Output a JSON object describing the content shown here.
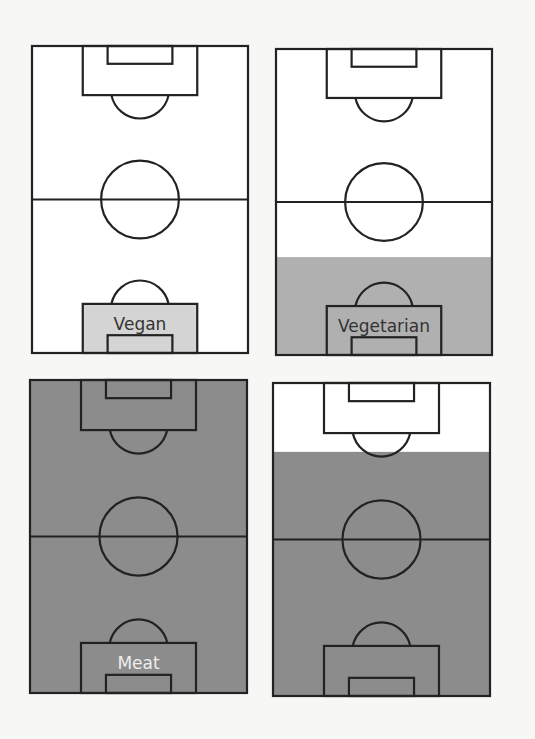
{
  "colors": {
    "background": "#f7f7f5",
    "pitch_white": "#ffffff",
    "line": "#222222",
    "vegan_fill": "#d4d4d4",
    "vegetarian_fill": "#b0b0b0",
    "meat_fill": "#8c8c8c",
    "label_dark": "#333333",
    "label_light": "#eeeeee"
  },
  "pitches": [
    {
      "id": "vegan",
      "label": "Vegan",
      "label_color": "#333333",
      "fill_mode": "penalty_box",
      "fill_color": "#d4d4d4",
      "fill_fraction": 0.16,
      "x": 32,
      "y": 46,
      "w": 216,
      "h": 307
    },
    {
      "id": "vegetarian",
      "label": "Vegetarian",
      "label_color": "#333333",
      "fill_mode": "from_bottom",
      "fill_color": "#b0b0b0",
      "fill_fraction": 0.32,
      "x": 276,
      "y": 49,
      "w": 216,
      "h": 306
    },
    {
      "id": "meat",
      "label": "Meat",
      "label_color": "#eeeeee",
      "fill_mode": "from_bottom",
      "fill_color": "#8c8c8c",
      "fill_fraction": 1.0,
      "x": 30,
      "y": 380,
      "w": 217,
      "h": 313
    },
    {
      "id": "unlabeled",
      "label": "",
      "label_color": "#333333",
      "fill_mode": "from_bottom",
      "fill_color": "#8c8c8c",
      "fill_fraction": 0.78,
      "x": 273,
      "y": 383,
      "w": 217,
      "h": 313
    }
  ]
}
